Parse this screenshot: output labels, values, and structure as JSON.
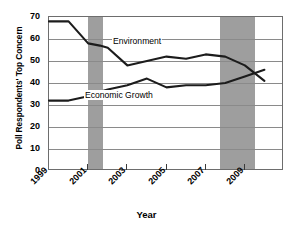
{
  "chart_data": {
    "type": "line",
    "title": "",
    "xlabel": "Year",
    "ylabel": "Poll Respondents' Top Concern",
    "xlim": [
      1999,
      2011
    ],
    "ylim": [
      0,
      70
    ],
    "grid": true,
    "legend_position": "inline-labels",
    "yticks": [
      70,
      60,
      50,
      40,
      30,
      20,
      10,
      0
    ],
    "xticks": [
      1999,
      2001,
      2003,
      2005,
      2007,
      2009
    ],
    "xtick_labels": [
      "1999",
      "2001",
      "2003",
      "2005",
      "2007",
      "2009"
    ],
    "x": [
      1999,
      2000,
      2001,
      2001.6,
      2002,
      2003,
      2004,
      2005,
      2006,
      2007,
      2008,
      2009,
      2010
    ],
    "series": [
      {
        "name": "Environment",
        "color": "#1c1c1c",
        "values": [
          68,
          68,
          58,
          57,
          56,
          48,
          50,
          52,
          51,
          53,
          52,
          48,
          41
        ]
      },
      {
        "name": "Economic Growth",
        "color": "#1c1c1c",
        "values": [
          32,
          32,
          34,
          36,
          37,
          39,
          42,
          38,
          39,
          39,
          40,
          43,
          46
        ]
      }
    ],
    "annotations": [
      {
        "text": "Environment",
        "x": 2005,
        "y": 57
      },
      {
        "text": "Economic Growth",
        "x": 2003.4,
        "y": 33
      }
    ],
    "shaded_bands": [
      {
        "name": "recession-band-2001",
        "x0": 2001.0,
        "x1": 2001.75,
        "color": "#9e9e9e"
      },
      {
        "name": "recession-band-2008",
        "x0": 2007.75,
        "x1": 2009.5,
        "color": "#9e9e9e"
      }
    ]
  },
  "axes": {
    "y_title": "Poll Respondents' Top Concern",
    "x_title": "Year",
    "y_labels": [
      "70",
      "60",
      "50",
      "40",
      "30",
      "20",
      "10",
      "0"
    ],
    "x_labels": [
      "1999",
      "2001",
      "2003",
      "2005",
      "2007",
      "2009"
    ]
  },
  "labels": {
    "environment": "Environment",
    "economic_growth": "Economic Growth"
  },
  "colors": {
    "line": "#1c1c1c",
    "band": "#9e9e9e",
    "grid": "#8a8a8a",
    "frame": "#6d6d6d",
    "background": "#ffffff"
  }
}
